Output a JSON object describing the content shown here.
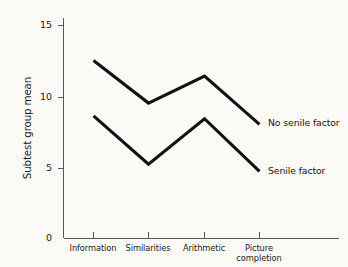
{
  "chart_data": {
    "type": "line",
    "title": "",
    "xlabel": "",
    "ylabel": "Subtest group mean",
    "categories": [
      "Information",
      "Similarities",
      "Arithmetic",
      "Picture completion"
    ],
    "category_lines": [
      [
        "Information"
      ],
      [
        "Similarities"
      ],
      [
        "Arithmetic"
      ],
      [
        "Picture",
        "completion"
      ]
    ],
    "ylim": [
      0,
      15
    ],
    "yticks": [
      0,
      5,
      10,
      15
    ],
    "ytick_labels": [
      "0",
      "5",
      "10",
      "15"
    ],
    "grid": false,
    "legend_position": "inline-right-of-line-ends",
    "series": [
      {
        "name": "No senile factor",
        "values": [
          12.5,
          9.5,
          11.4,
          8.0
        ],
        "color": "#121212"
      },
      {
        "name": "Senile factor",
        "values": [
          8.6,
          5.2,
          8.4,
          4.7
        ],
        "color": "#121212"
      }
    ]
  },
  "axes": {
    "y_title": "Subtest group mean"
  },
  "labels": {
    "series_no_senile": "No senile factor",
    "series_senile": "Senile factor"
  }
}
